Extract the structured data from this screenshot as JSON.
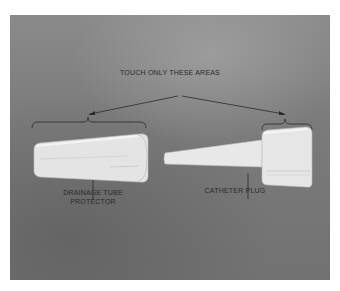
{
  "figure": {
    "header_label": "TOUCH ONLY THESE AREAS",
    "items": [
      {
        "name": "drainage-tube-protector",
        "label_line1": "DRAINAGE TUBE",
        "label_line2": "PROTECTOR"
      },
      {
        "name": "catheter-plug",
        "label_line1": "CATHETER PLUG"
      }
    ],
    "colors": {
      "background": "#7b7b7b",
      "object": "#e6e6e6",
      "ink": "#2a2a2a"
    }
  }
}
